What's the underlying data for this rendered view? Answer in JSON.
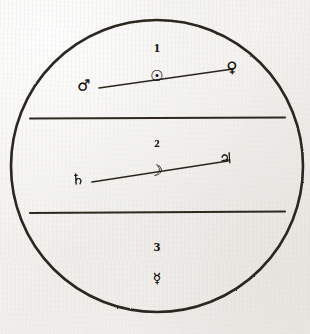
{
  "figure": {
    "medium": "ink drawing on aged paper",
    "ink_color": "#17150f",
    "paper_color": "#f1f0ec",
    "circle": {
      "cx": 157,
      "cy": 166,
      "r": 146
    },
    "divider_lines": [
      {
        "name": "upper-divider",
        "y": 118,
        "x1": 30,
        "x2": 285
      },
      {
        "name": "lower-divider",
        "y": 212,
        "x1": 30,
        "x2": 285
      }
    ],
    "bands": [
      {
        "id": "band-1",
        "numeral": "1",
        "numeral_x": 157,
        "numeral_y": 48,
        "connector": {
          "x1": 99,
          "y1": 88,
          "x2": 233,
          "y2": 70
        },
        "symbols": [
          {
            "name": "mars",
            "glyph": "♂",
            "label": "Mars",
            "x": 84,
            "y": 86,
            "size": 15
          },
          {
            "name": "sun",
            "glyph": "☉",
            "label": "Sun",
            "x": 157,
            "y": 76,
            "size": 15
          },
          {
            "name": "venus",
            "glyph": "♀",
            "label": "Venus",
            "x": 232,
            "y": 68,
            "size": 15
          }
        ]
      },
      {
        "id": "band-2",
        "numeral": "2",
        "numeral_x": 157,
        "numeral_y": 143,
        "connector": {
          "x1": 93,
          "y1": 182,
          "x2": 226,
          "y2": 162
        },
        "symbols": [
          {
            "name": "saturn",
            "glyph": "♄",
            "label": "Saturn",
            "x": 78,
            "y": 180,
            "size": 15
          },
          {
            "name": "moon",
            "glyph": "☽",
            "label": "Moon",
            "x": 156,
            "y": 171,
            "size": 15
          },
          {
            "name": "jupiter",
            "glyph": "♃",
            "label": "Jupiter",
            "x": 226,
            "y": 159,
            "size": 15
          }
        ]
      },
      {
        "id": "band-3",
        "numeral": "3",
        "numeral_x": 157,
        "numeral_y": 246,
        "connector": null,
        "symbols": [
          {
            "name": "mercury",
            "glyph": "☿",
            "label": "Mercury",
            "x": 157,
            "y": 278,
            "size": 14
          }
        ]
      }
    ]
  }
}
